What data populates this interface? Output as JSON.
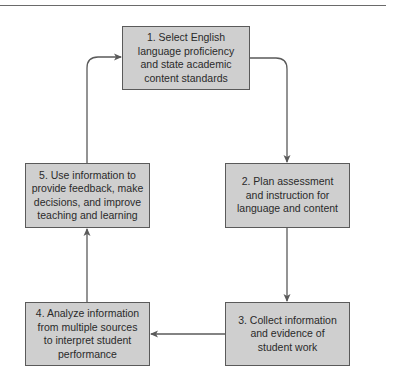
{
  "diagram": {
    "type": "cycle-flowchart",
    "colors": {
      "box_fill": "#cfcfcf",
      "box_border": "#5a5a5a",
      "connector": "#5a5a5a",
      "text": "#2a2a2a"
    },
    "steps": [
      {
        "id": 1,
        "text": "1. Select English language proficiency and state academic content standards",
        "lines": [
          "1. Select English",
          "language proficiency",
          "and state academic",
          "content standards"
        ]
      },
      {
        "id": 2,
        "text": "2. Plan assessment and instruction for language and content",
        "lines": [
          "2. Plan assessment",
          "and instruction for",
          "language and content"
        ]
      },
      {
        "id": 3,
        "text": "3. Collect information and evidence of student work",
        "lines": [
          "3. Collect information",
          "and evidence of",
          "student work"
        ]
      },
      {
        "id": 4,
        "text": "4. Analyze information from multiple sources to interpret student performance",
        "lines": [
          "4. Analyze information",
          "from multiple sources",
          "to interpret student",
          "performance"
        ]
      },
      {
        "id": 5,
        "text": "5. Use information to provide feedback, make decisions, and improve teaching and learning",
        "lines": [
          "5. Use information to",
          "provide feedback, make",
          "decisions, and improve",
          "teaching and learning"
        ]
      }
    ],
    "edges": [
      {
        "from": 1,
        "to": 2
      },
      {
        "from": 2,
        "to": 3
      },
      {
        "from": 3,
        "to": 4
      },
      {
        "from": 4,
        "to": 5
      },
      {
        "from": 5,
        "to": 1
      }
    ]
  }
}
